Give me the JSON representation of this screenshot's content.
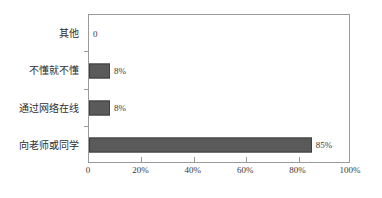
{
  "chart_data": {
    "type": "bar",
    "orientation": "horizontal",
    "title": "",
    "subtitle": "",
    "xlabel": "",
    "ylabel": "",
    "xlim": [
      0,
      100
    ],
    "grid": false,
    "legend": false,
    "categories": [
      "其他",
      "不懂就不懂",
      "通过网络在线",
      "向老师或同学"
    ],
    "values": [
      0,
      8,
      8,
      85
    ],
    "value_labels": [
      "0",
      "8%",
      "8%",
      "85%"
    ],
    "xticks": [
      0,
      20,
      40,
      60,
      80,
      100
    ],
    "xtick_labels": [
      "0",
      "20%",
      "40%",
      "60%",
      "80%",
      "100%"
    ],
    "bar_color": "#5a5a5a",
    "bar_border_color": "#3f3f3f",
    "axis_color": "#9a9a9a",
    "background": "#ffffff"
  }
}
